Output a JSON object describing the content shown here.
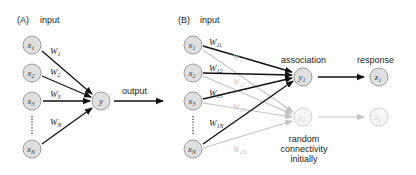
{
  "panel_a": {
    "label": "(A)",
    "input_label": "input",
    "inputs": [
      {
        "name": "x",
        "sub": "1"
      },
      {
        "name": "x",
        "sub": "2"
      },
      {
        "name": "x",
        "sub": "3"
      },
      {
        "name": "x",
        "sub": "N"
      }
    ],
    "weights": [
      {
        "name": "W",
        "sub": "1"
      },
      {
        "name": "W",
        "sub": "2"
      },
      {
        "name": "W",
        "sub": "3"
      },
      {
        "name": "W",
        "sub": "N"
      }
    ],
    "output_node": "y",
    "output_label": "output"
  },
  "panel_b": {
    "label": "(B)",
    "input_label": "input",
    "inputs": [
      {
        "name": "x",
        "sub": "1"
      },
      {
        "name": "x",
        "sub": "2"
      },
      {
        "name": "x",
        "sub": "3"
      },
      {
        "name": "x",
        "sub": "N"
      }
    ],
    "weights_strong": [
      {
        "name": "W",
        "sub": "11"
      },
      {
        "name": "W",
        "sub": "12"
      },
      {
        "name": "W",
        "sub": "13"
      },
      {
        "name": "W",
        "sub": "1N"
      }
    ],
    "weights_faint": [
      {
        "name": "W",
        "sub": "21"
      },
      {
        "name": "W",
        "sub": "22"
      },
      {
        "name": "W",
        "sub": "23"
      },
      {
        "name": "W",
        "sub": "2N"
      }
    ],
    "association_label": "association",
    "response_label": "response",
    "association_nodes": [
      {
        "name": "y",
        "sub": "1"
      },
      {
        "name": "y",
        "sub": "2"
      }
    ],
    "response_nodes": [
      {
        "name": "z",
        "sub": "1"
      },
      {
        "name": "z",
        "sub": "2"
      }
    ],
    "note_lines": [
      "random",
      "connectivity",
      "initially"
    ]
  },
  "colors": {
    "node_fill": "#e0e0e0",
    "node_stroke": "#9a9a9a",
    "strong_edge": "#111111",
    "faint_edge": "#c4c4c4"
  }
}
